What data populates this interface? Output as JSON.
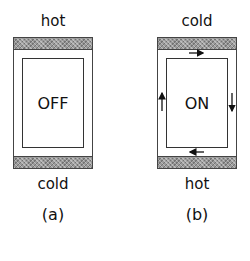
{
  "panels": [
    {
      "id": "a",
      "top_label": "hot",
      "state": "OFF",
      "bottom_label": "cold",
      "caption": "(a)",
      "has_circulation_arrows": false
    },
    {
      "id": "b",
      "top_label": "cold",
      "state": "ON",
      "bottom_label": "hot",
      "caption": "(b)",
      "has_circulation_arrows": true,
      "arrows": [
        "top: right",
        "right: down",
        "bottom: left",
        "left: up"
      ]
    }
  ],
  "colors": {
    "band_fill": "#9a9a9a",
    "outline": "#444444",
    "background": "#ffffff"
  }
}
